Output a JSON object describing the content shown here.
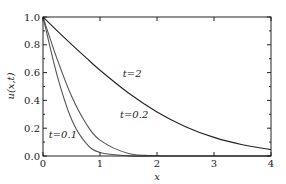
{
  "chart_data": {
    "type": "line",
    "title": "",
    "xlabel": "x",
    "ylabel": "u(x,t)",
    "xlim": [
      0,
      4
    ],
    "ylim": [
      0,
      1.0
    ],
    "grid": false,
    "legend": "inline annotations",
    "x_ticks": [
      "0",
      "1",
      "2",
      "3",
      "4"
    ],
    "y_ticks": [
      "0.0",
      "0.2",
      "0.4",
      "0.6",
      "0.8",
      "1.0"
    ],
    "x": [
      0,
      0.25,
      0.5,
      0.75,
      1.0,
      1.5,
      2.0,
      2.5,
      3.0,
      3.5,
      4.0
    ],
    "series": [
      {
        "name": "t=0.1",
        "values": [
          1.0,
          0.576,
          0.264,
          0.094,
          0.025,
          0.001,
          0.0,
          0.0,
          0.0,
          0.0,
          0.0
        ]
      },
      {
        "name": "t=0.2",
        "values": [
          1.0,
          0.695,
          0.431,
          0.237,
          0.114,
          0.018,
          0.002,
          0.0,
          0.0,
          0.0,
          0.0
        ]
      },
      {
        "name": "t=2",
        "values": [
          1.0,
          0.9,
          0.803,
          0.709,
          0.617,
          0.453,
          0.317,
          0.211,
          0.134,
          0.081,
          0.046
        ]
      }
    ],
    "annotations": [
      {
        "text": "t=2",
        "x": 1.4,
        "y": 0.57
      },
      {
        "text": "t=0.2",
        "x": 1.35,
        "y": 0.27
      },
      {
        "text": "t=0.1",
        "x": 0.1,
        "y": 0.13
      }
    ]
  }
}
